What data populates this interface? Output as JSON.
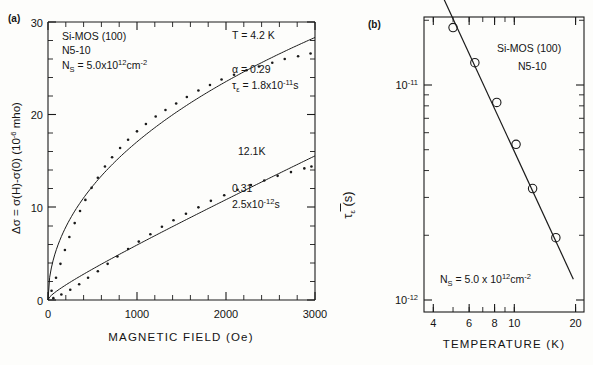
{
  "figure": {
    "panel_a_label": "(a)",
    "panel_b_label": "(b)"
  },
  "panel_a": {
    "annotations": {
      "sample_material": "Si-MOS (100)",
      "sample_id": "N5-10",
      "density_label": "N",
      "density_sub": "S",
      "density_value": " = 5.0x10",
      "density_exp": "12",
      "density_unit": "cm",
      "density_unit_exp": "-2",
      "curve1_temperature": "T = 4.2 K",
      "curve1_alpha": "α = 0.29",
      "curve1_tau_sym": "τ",
      "curve1_tau_sub": "ε",
      "curve1_tau_val": " = 1.8x10",
      "curve1_tau_exp": "-11",
      "curve1_tau_unit": "s",
      "curve2_temperature": "12.1K",
      "curve2_alpha": "0.31",
      "curve2_tau_val": "2.5x10",
      "curve2_tau_exp": "-12",
      "curve2_tau_unit": "s"
    },
    "ylabel_parts": {
      "p1": "Δσ = σ(H)-σ(0)   (10",
      "exp": "-6",
      "p2": " mho)"
    },
    "xlabel": "MAGNETIC FIELD (Oe)",
    "yticks": [
      "0",
      "10",
      "20",
      "30"
    ],
    "xticks": [
      "0",
      "1000",
      "2000",
      "3000"
    ]
  },
  "panel_b": {
    "annotations": {
      "sample_material": "Si-MOS (100)",
      "sample_id": "N5-10",
      "density_label": "N",
      "density_sub": "S",
      "density_value": " = 5.0 x 10",
      "density_exp": "12",
      "density_unit": "cm",
      "density_unit_exp": "-2"
    },
    "ylabel_parts": {
      "sym": "τ",
      "sub": "ε",
      "unit": " (s)"
    },
    "xlabel": "TEMPERATURE  (K)",
    "yticks": [
      "10",
      "10"
    ],
    "ytick_exps": [
      "-11",
      "-12"
    ],
    "xticks": [
      "4",
      "6",
      "8",
      "10",
      "20"
    ]
  },
  "chart_data": [
    {
      "type": "scatter",
      "title": "(a) Magnetoconductance vs magnetic field",
      "xlabel": "MAGNETIC FIELD (Oe)",
      "ylabel": "Δσ = σ(H)-σ(0)  (10^-6 mho)",
      "xlim": [
        0,
        3000
      ],
      "ylim": [
        0,
        30
      ],
      "xticks": [
        0,
        1000,
        2000,
        3000
      ],
      "yticks": [
        0,
        10,
        20,
        30
      ],
      "grid": false,
      "legend": "none",
      "series": [
        {
          "name": "T = 4.2 K",
          "alpha": 0.29,
          "tau_epsilon_s": 1.8e-11,
          "x": [
            40,
            90,
            140,
            190,
            240,
            300,
            360,
            420,
            490,
            560,
            640,
            720,
            810,
            900,
            1000,
            1100,
            1210,
            1320,
            1440,
            1560,
            1690,
            1820,
            1950,
            2090,
            2230,
            2370,
            2520,
            2660,
            2810,
            2950
          ],
          "y": [
            1.0,
            2.4,
            3.9,
            5.4,
            6.8,
            8.3,
            9.6,
            10.8,
            12.1,
            13.2,
            14.4,
            15.4,
            16.4,
            17.3,
            18.2,
            19.0,
            19.8,
            20.5,
            21.2,
            21.9,
            22.6,
            23.2,
            23.8,
            24.3,
            24.8,
            25.2,
            25.6,
            26.0,
            26.3,
            26.6
          ]
        },
        {
          "name": "12.1 K",
          "alpha": 0.31,
          "tau_epsilon_s": 2.5e-12,
          "x": [
            60,
            150,
            250,
            350,
            450,
            560,
            670,
            780,
            900,
            1020,
            1150,
            1280,
            1410,
            1550,
            1690,
            1830,
            1980,
            2130,
            2280,
            2430,
            2580,
            2730,
            2880,
            2960
          ],
          "y": [
            0.2,
            0.6,
            1.1,
            1.7,
            2.4,
            3.1,
            3.9,
            4.7,
            5.5,
            6.3,
            7.1,
            7.9,
            8.6,
            9.3,
            10.0,
            10.7,
            11.3,
            11.9,
            12.4,
            12.9,
            13.4,
            13.8,
            14.2,
            14.4
          ]
        }
      ]
    },
    {
      "type": "scatter",
      "title": "(b) Inelastic scattering time vs temperature",
      "xlabel": "TEMPERATURE  (K)",
      "ylabel": "τ̃_ε (s)",
      "xscale": "log",
      "yscale": "log",
      "xlim": [
        3.6,
        22
      ],
      "ylim": [
        8e-13,
        3.5e-11
      ],
      "xticks": [
        4,
        6,
        8,
        10,
        20
      ],
      "yticks": [
        1e-11,
        1e-12
      ],
      "grid": false,
      "legend": "none",
      "points": {
        "T_K": [
          4.2,
          5.0,
          6.4,
          8.2,
          10.2,
          12.3,
          16.0
        ],
        "tau_s": [
          2.95e-11,
          1.85e-11,
          1.27e-11,
          8.3e-12,
          5.3e-12,
          3.3e-12,
          1.95e-12
        ]
      },
      "fit_line": {
        "T_K": [
          4.1,
          19.5
        ],
        "tau_s": [
          3.05e-11,
          1.25e-12
        ],
        "slope_exponent": -1.37
      }
    }
  ]
}
